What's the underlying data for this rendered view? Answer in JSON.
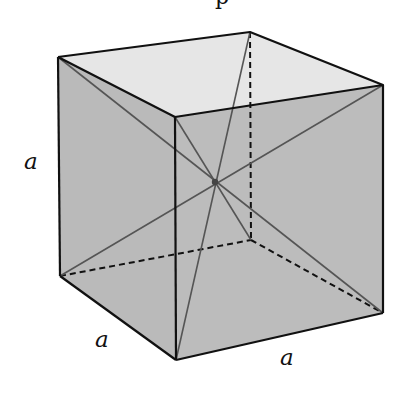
{
  "figure": {
    "type": "cube-space-diagonals",
    "colors": {
      "top_face": "#e6e6e6",
      "side_face": "#b9b9b9",
      "front_face": "#bdbdbd",
      "edge": "#111111",
      "diagonal": "#555555",
      "center_point": "#444444"
    },
    "vertices": {
      "back_top_left": [
        58,
        57
      ],
      "back_top_right": [
        250,
        32
      ],
      "front_top_left": [
        175,
        117
      ],
      "front_top_right": [
        383,
        85
      ],
      "back_bottom_left": [
        60,
        276
      ],
      "back_bottom_right": [
        251,
        240
      ],
      "front_bottom_left": [
        176,
        360
      ],
      "front_bottom_right": [
        383,
        313
      ]
    },
    "center": [
      215,
      182
    ],
    "labels": {
      "height": "a",
      "depth": "a",
      "width": "a"
    },
    "clipped_top_text": "p"
  }
}
